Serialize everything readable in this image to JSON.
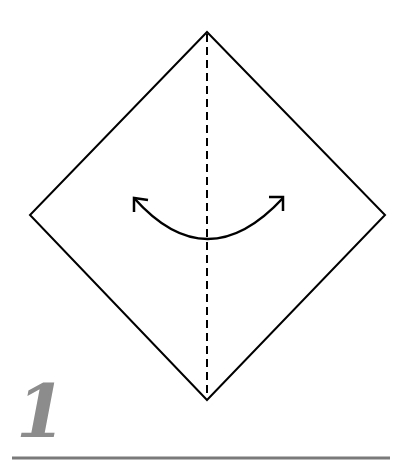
{
  "diagram": {
    "type": "origami-step",
    "step_number": "1",
    "shape": "square-diamond",
    "fold_line": "valley-fold-vertical-dashed",
    "action": "fold-and-unfold",
    "colors": {
      "outline": "#000000",
      "step_number": "#8c8c8c",
      "underline": "#7a7a7a",
      "background": "#ffffff"
    }
  }
}
